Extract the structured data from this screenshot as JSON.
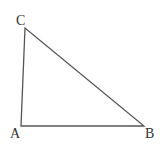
{
  "diagram": {
    "type": "triangle",
    "stroke_color": "#555555",
    "vertices": [
      {
        "label": "A",
        "x": 21,
        "y": 126
      },
      {
        "label": "B",
        "x": 144,
        "y": 126
      },
      {
        "label": "C",
        "x": 25,
        "y": 28
      }
    ],
    "labels": {
      "A": "A",
      "B": "B",
      "C": "C"
    }
  }
}
